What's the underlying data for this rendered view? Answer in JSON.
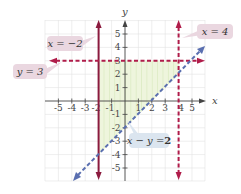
{
  "figure": {
    "axes": {
      "x_label": "x",
      "y_label": "y",
      "x_ticks": [
        "-5",
        "-4",
        "-3",
        "-2",
        "-1",
        "1",
        "2",
        "3",
        "4",
        "5"
      ],
      "y_ticks": [
        "5",
        "4",
        "3",
        "2",
        "1",
        "-1",
        "-2",
        "-3",
        "-4",
        "-5"
      ],
      "x_range": [
        -6,
        6
      ],
      "y_range": [
        -6,
        6
      ]
    },
    "lines": [
      {
        "equation": "x = -2",
        "style": "solid",
        "color": "#8b1a3e"
      },
      {
        "equation": "x = 4",
        "style": "dashed",
        "color": "#b01c4a"
      },
      {
        "equation": "y = 3",
        "style": "dashed",
        "color": "#b01c4a"
      },
      {
        "equation": "x - y = 2",
        "style": "dashed",
        "color": "#5a6fb0"
      }
    ],
    "shaded_region": {
      "description": "x >= -2, x < 4, y < 3, x - y < 2",
      "color": "#e4f0cf"
    },
    "callouts": {
      "x_neg2": "x = −2",
      "y_3": "y = 3",
      "x_4": "x = 4",
      "x_minus_y_left": "x − y = ",
      "x_minus_y_right": "2"
    }
  }
}
